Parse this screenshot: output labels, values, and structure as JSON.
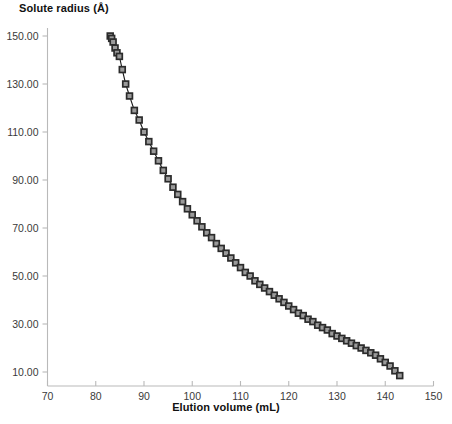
{
  "chart_data": {
    "type": "line",
    "title": "Solute radius (Å)",
    "xlabel": "Elution volume (mL)",
    "ylabel": "Solute radius (Å)",
    "xlim": [
      70,
      150
    ],
    "ylim": [
      0,
      150
    ],
    "xticks": [
      70,
      80,
      90,
      100,
      110,
      120,
      130,
      140,
      150
    ],
    "xtick_labels": [
      "70",
      "80",
      "90",
      "100",
      "110",
      "120",
      "130",
      "140",
      "150"
    ],
    "yticks": [
      10,
      30,
      50,
      70,
      90,
      110,
      130,
      150
    ],
    "ytick_labels": [
      "10.00",
      "30.00",
      "50.00",
      "70.00",
      "90.00",
      "110.00",
      "130.00",
      "150.00"
    ],
    "grid": false,
    "legend": null,
    "marker": "open-square",
    "marker_color": "#2b2b2b",
    "marker_fill": "#9a9a9a",
    "line_color": "#1a1a1a",
    "series": [
      {
        "name": "Solute radius calibration",
        "x": [
          83.0,
          83.3,
          83.6,
          84.0,
          84.4,
          84.9,
          85.5,
          86.2,
          87.0,
          88.0,
          89.0,
          90.0,
          91.0,
          92.0,
          93.0,
          94.0,
          95.0,
          96.0,
          97.0,
          98.0,
          99.0,
          100.0,
          101.0,
          102.0,
          103.0,
          104.0,
          105.0,
          106.0,
          107.0,
          108.0,
          109.0,
          110.0,
          111.0,
          112.0,
          113.0,
          114.0,
          115.0,
          116.0,
          117.0,
          118.0,
          119.0,
          120.0,
          121.0,
          122.0,
          123.0,
          124.0,
          125.0,
          126.0,
          127.0,
          128.0,
          129.0,
          130.0,
          131.0,
          132.0,
          133.0,
          134.0,
          135.0,
          136.0,
          137.0,
          138.0,
          139.0,
          140.0,
          141.0,
          142.0,
          143.0
        ],
        "y": [
          150.0,
          149.0,
          147.5,
          145.0,
          143.0,
          141.5,
          136.0,
          130.0,
          125.0,
          119.0,
          115.0,
          110.0,
          106.0,
          102.0,
          98.0,
          94.0,
          90.5,
          87.0,
          84.0,
          81.0,
          78.0,
          75.5,
          73.0,
          70.5,
          68.0,
          66.0,
          63.5,
          61.5,
          59.5,
          57.5,
          55.5,
          53.5,
          51.5,
          50.0,
          48.0,
          46.5,
          45.0,
          43.5,
          42.0,
          40.5,
          39.0,
          37.5,
          36.0,
          34.5,
          33.5,
          32.0,
          31.0,
          29.5,
          28.5,
          27.5,
          26.0,
          25.0,
          24.0,
          23.0,
          22.0,
          21.0,
          20.0,
          19.0,
          18.0,
          17.0,
          15.5,
          14.0,
          12.5,
          10.5,
          8.5
        ]
      }
    ]
  }
}
